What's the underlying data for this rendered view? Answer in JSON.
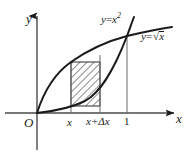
{
  "figure": {
    "width": 191,
    "height": 158,
    "background": "#ffffff",
    "ink": "#1a1a1a"
  },
  "axes": {
    "x_label": "x",
    "y_label": "y",
    "origin_label": "O",
    "x_axis_y_px": 113,
    "y_axis_x_px": 37,
    "x_axis_end_px": 181,
    "y_axis_top_px": 12,
    "y_axis_bottom_px": 150
  },
  "ticks": {
    "x": [
      {
        "label": "x",
        "px": 71
      },
      {
        "label": "x+Δx",
        "px": 100
      },
      {
        "label": "1",
        "px": 127
      }
    ]
  },
  "curves": [
    {
      "name": "parabola",
      "label_plain": "y=x²",
      "label_lhs": "y",
      "label_eq": "=",
      "label_base": "x",
      "label_exponent": "2",
      "color": "#1a1a1a"
    },
    {
      "name": "square-root",
      "label_plain": "y=√x",
      "label_lhs": "y",
      "label_eq": "=",
      "label_radicand": "x",
      "color": "#1a1a1a"
    }
  ],
  "strip": {
    "name": "hatched-element",
    "left_px": 71,
    "right_px": 100,
    "top_px": 62,
    "bottom_px": 106,
    "hatch_color": "#2b2b2b",
    "fill": "#ffffff",
    "description": "vertical strip from x to x+Δx between the two curves"
  },
  "verticals": [
    {
      "name": "vertical-at-x",
      "px": 71,
      "top_px": 62,
      "bottom_px": 113
    },
    {
      "name": "vertical-at-x-plus-dx",
      "px": 100,
      "top_px": 55,
      "bottom_px": 113
    },
    {
      "name": "vertical-at-one",
      "px": 127,
      "top_px": 36,
      "bottom_px": 113
    }
  ],
  "intersection": {
    "x_px": 127,
    "y_px": 36,
    "label": ""
  }
}
